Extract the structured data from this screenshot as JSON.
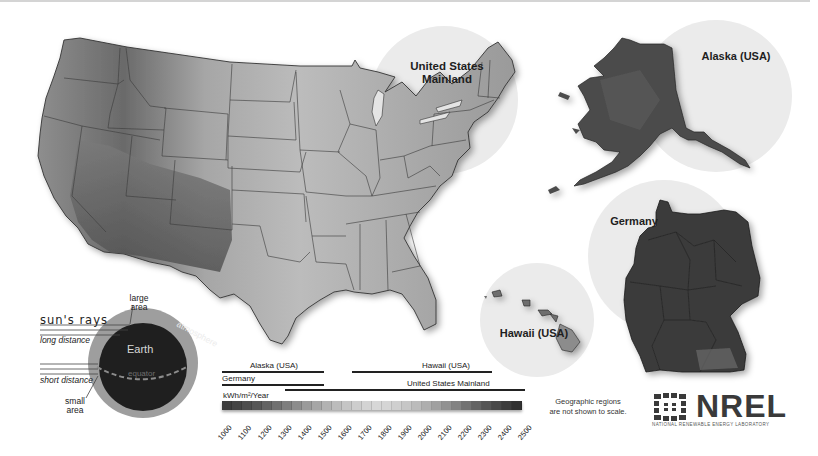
{
  "map": {
    "regions": [
      {
        "id": "us-mainland",
        "label": "United States Mainland"
      },
      {
        "id": "alaska",
        "label": "Alaska (USA)"
      },
      {
        "id": "germany",
        "label": "Germany"
      },
      {
        "id": "hawaii",
        "label": "Hawaii (USA)"
      }
    ],
    "labels": {
      "us_line1": "United States",
      "us_line2": "Mainland",
      "alaska": "Alaska (USA)",
      "germany": "Germany",
      "hawaii": "Hawaii (USA)"
    }
  },
  "diagram": {
    "sun_rays": "sun's rays",
    "long_distance": "long distance",
    "short_distance": "short distance",
    "large_area_1": "large",
    "large_area_2": "area",
    "small_area_1": "small",
    "small_area_2": "area",
    "earth": "Earth",
    "equator": "equator",
    "atmosphere": "atmosphere"
  },
  "legend": {
    "unit": "kWh/m²/Year",
    "ranges": [
      {
        "label": "Alaska (USA)",
        "from": 1000,
        "to": 1500
      },
      {
        "label": "Germany",
        "from": 1000,
        "to": 1500
      },
      {
        "label": "Hawaii (USA)",
        "from": 1650,
        "to": 2350
      },
      {
        "label": "United States Mainland",
        "from": 1300,
        "to": 2500
      }
    ],
    "ticks": [
      "1000",
      "1100",
      "1200",
      "1300",
      "1400",
      "1500",
      "1600",
      "1700",
      "1800",
      "1900",
      "2000",
      "2100",
      "2200",
      "2300",
      "2400",
      "2500"
    ],
    "ramp_colors": [
      "#3c3c3c",
      "#444444",
      "#4d4d4d",
      "#565656",
      "#636363",
      "#707070",
      "#7e7e7e",
      "#8c8c8c",
      "#9a9a9a",
      "#a6a6a6",
      "#b2b2b2",
      "#bcbcbc",
      "#c5c5c5",
      "#cdcdcd",
      "#d3d3d3",
      "#d7d7d7",
      "#d5d5d5",
      "#cfcfcf",
      "#c6c6c6",
      "#bbbbbb",
      "#aeaeae",
      "#a0a0a0",
      "#919191",
      "#828282",
      "#727272",
      "#636363",
      "#555555",
      "#484848",
      "#3c3c3c",
      "#303030"
    ]
  },
  "note": {
    "line1": "Geographic regions",
    "line2": "are not shown to scale."
  },
  "logo": {
    "word": "NREL",
    "subtitle": "NATIONAL RENEWABLE ENERGY LABORATORY"
  }
}
